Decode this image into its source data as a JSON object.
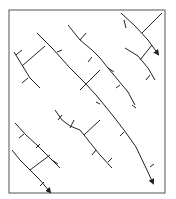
{
  "diagram": {
    "type": "fracture-stream-network",
    "stroke_color": "#222222",
    "frame_color": "#555555",
    "frame": {
      "x": 9,
      "y": 10,
      "w": 156,
      "h": 183
    },
    "main_lines": [
      {
        "id": "a",
        "points": "37,33 52,48 70,68 84,82 96,95 110,112 124,130 136,147 146,168 153,183",
        "arrow": true
      },
      {
        "id": "b",
        "points": "68,25 80,40 92,50 100,58 108,68 118,80 128,92 135,105"
      },
      {
        "id": "c",
        "points": "121,13 135,26 148,40 158,54",
        "arrow": true
      },
      {
        "id": "d",
        "points": "125,48 138,56 148,68 155,80"
      },
      {
        "id": "e",
        "points": "14,52 22,65 30,78 40,88"
      },
      {
        "id": "f",
        "points": "55,110 62,120 70,126 80,130 92,145 100,155 112,168"
      },
      {
        "id": "g",
        "points": "15,123 26,135 38,146 50,158 60,168"
      },
      {
        "id": "h",
        "points": "12,150 20,160 30,170 40,180 50,192",
        "arrow": true
      }
    ],
    "cross_links": [
      {
        "points": "22,66 45,46"
      },
      {
        "points": "80,90 100,70"
      },
      {
        "points": "142,33 162,13"
      },
      {
        "points": "140,60 152,45"
      },
      {
        "points": "84,135 100,120"
      },
      {
        "points": "30,170 50,155"
      }
    ],
    "ticks": [
      {
        "points": "16,55 22,50"
      },
      {
        "points": "28,78 22,83"
      },
      {
        "points": "80,40 86,33"
      },
      {
        "points": "92,57 88,62"
      },
      {
        "points": "108,68 114,72"
      },
      {
        "points": "120,85 116,88"
      },
      {
        "points": "132,105 136,108"
      },
      {
        "points": "96,102 100,104"
      },
      {
        "points": "120,136 124,132"
      },
      {
        "points": "150,167 154,164"
      },
      {
        "points": "58,120 62,115"
      },
      {
        "points": "70,128 74,120"
      },
      {
        "points": "96,150 92,155"
      },
      {
        "points": "108,162 112,158"
      },
      {
        "points": "24,134 19,138"
      },
      {
        "points": "40,144 36,148"
      },
      {
        "points": "52,160 58,164"
      },
      {
        "points": "40,186 44,182"
      },
      {
        "points": "150,75 146,80"
      },
      {
        "points": "57,52 62,50"
      },
      {
        "points": "124,20 126,28"
      }
    ]
  }
}
